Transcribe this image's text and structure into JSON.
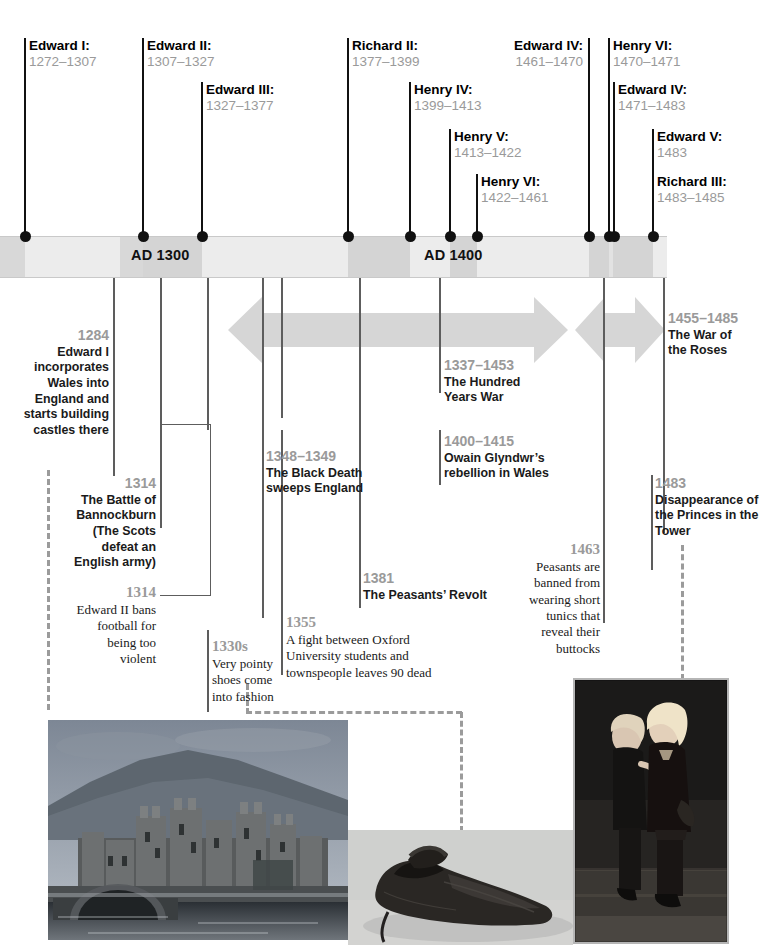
{
  "timeline_bar": {
    "labels": [
      "AD 1300",
      "AD 1400"
    ]
  },
  "monarchs": [
    {
      "name": "Edward I:",
      "years": "1272–1307"
    },
    {
      "name": "Edward II:",
      "years": "1307–1327"
    },
    {
      "name": "Edward III:",
      "years": "1327–1377"
    },
    {
      "name": "Richard II:",
      "years": "1377–1399"
    },
    {
      "name": "Henry IV:",
      "years": "1399–1413"
    },
    {
      "name": "Henry V:",
      "years": "1413–1422"
    },
    {
      "name": "Henry VI:",
      "years": "1422–1461"
    },
    {
      "name": "Edward IV:",
      "years": "1461–1470"
    },
    {
      "name": "Henry VI:",
      "years": "1470–1471"
    },
    {
      "name": "Edward IV:",
      "years": "1471–1483"
    },
    {
      "name": "Edward V:",
      "years": "1483"
    },
    {
      "name": "Richard III:",
      "years": "1483–1485"
    }
  ],
  "events": [
    {
      "year": "1284",
      "text": "Edward I incorporates Wales into England and starts building castles there"
    },
    {
      "year": "1314",
      "text": "The Battle of Bannockburn (The Scots defeat an English army)"
    },
    {
      "year": "1314",
      "text": "Edward II bans football for being too violent"
    },
    {
      "year": "1330s",
      "text": "Very pointy shoes come into fashion"
    },
    {
      "year": "1348–1349",
      "text": "The Black Death sweeps England"
    },
    {
      "year": "1355",
      "text": "A fight between Oxford University students and townspeople leaves 90 dead"
    },
    {
      "year": "1381",
      "text": "The Peasants’ Revolt"
    },
    {
      "year": "1337–1453",
      "text": "The Hundred Years War"
    },
    {
      "year": "1400–1415",
      "text": "Owain Glyndwr’s rebellion in Wales"
    },
    {
      "year": "1463",
      "text": "Peasants are banned from wearing short tunics that reveal their buttocks"
    },
    {
      "year": "1455–1485",
      "text": "The War of the Roses"
    },
    {
      "year": "1483",
      "text": "Disappearance of the Princes in the Tower"
    }
  ],
  "images": [
    {
      "caption": "conwy-castle-photo"
    },
    {
      "caption": "medieval-pointy-shoe-photo"
    },
    {
      "caption": "princes-in-the-tower-painting"
    }
  ],
  "colors": {
    "tick": "#111111",
    "year_gray": "#9a9a9a",
    "text_dark": "#1a1a1a",
    "bar_light": "#ededed",
    "bar_mid": "#dcdcdc",
    "bar_dark": "#cfcfcf",
    "arrow": "#d6d6d6",
    "line": "#5d5d5d",
    "dash": "#9b9b9b"
  }
}
